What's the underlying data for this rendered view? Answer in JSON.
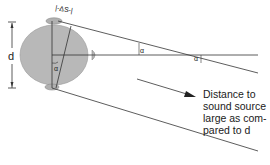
{
  "diagram": {
    "labels": {
      "d": "d",
      "delta_s": "|-ΔS-|",
      "alpha_head": "α",
      "alpha_mid": "α",
      "alpha_far": "α"
    },
    "caption": {
      "line1": "Distance to",
      "line2": "sound source",
      "line3": "large as com-",
      "line4": "pared to d"
    },
    "colors": {
      "head_fill": "#b8b8b8",
      "head_stroke": "#8a8a8a",
      "line": "#333333",
      "text": "#1a1a1a"
    }
  }
}
